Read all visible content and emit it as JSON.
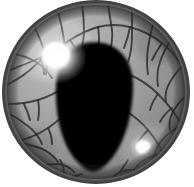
{
  "image": {
    "kind": "natural-image",
    "subject": "animal-eye-macro",
    "description": "Grayscale close-up of an animal eye with a vertical egg-shaped pupil",
    "width": 194,
    "height": 187,
    "background_color": "#ffffff",
    "color_mode": "grayscale"
  },
  "eyeball": {
    "label": "eyeball",
    "center_x": 96,
    "center_y": 92,
    "radius_x": 94,
    "radius_y": 92,
    "rim_color": "#3a3a3a",
    "rim_color_inner": "#6e6e6e",
    "rim_width": 7
  },
  "iris": {
    "label": "iris",
    "base_color": "#9a9a9a",
    "light_color": "#b8b8b8",
    "dark_color": "#6a6a6a",
    "cell_border_color": "#2e2e2e",
    "texture": "polygonal-cobblestone-cells",
    "cell_count": 34,
    "striation": "fine-radial-lines"
  },
  "pupil": {
    "label": "pupil",
    "shape": "egg-teardrop-vertical",
    "color": "#050505",
    "edge_color": "#1a1a1a",
    "center_x": 94,
    "center_y": 103,
    "width": 76,
    "height": 128,
    "top_y": 42,
    "bottom_y": 172
  },
  "highlights": [
    {
      "label": "primary-specular-highlight",
      "center_x": 57,
      "center_y": 57,
      "radius": 30,
      "color": "#ffffff",
      "intensity": 1.0
    },
    {
      "label": "secondary-specular-highlight",
      "center_x": 143,
      "center_y": 147,
      "radius": 15,
      "color": "#ffffff",
      "intensity": 0.95
    }
  ],
  "vignette": {
    "label": "edge-shading",
    "color": "#2b2b2b",
    "opacity": 0.55
  }
}
